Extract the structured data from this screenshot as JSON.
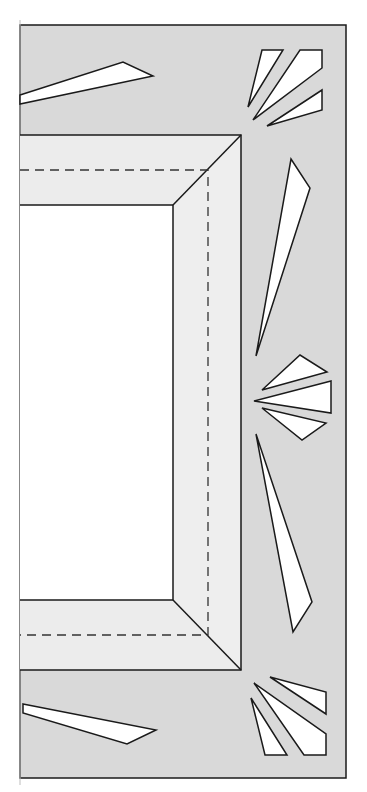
{
  "diagram": {
    "colors": {
      "background": "#ffffff",
      "board": "#d9d9d9",
      "frame_light": "#ececec",
      "window": "#ffffff",
      "cutout": "#ffffff",
      "stroke": "#1a1a1a"
    },
    "board": {
      "x1": 20,
      "y1": 25,
      "x2": 346,
      "y2": 778
    },
    "frame": {
      "outer_top": 135,
      "outer_bottom": 670,
      "outer_right": 241,
      "inner_top": 205,
      "inner_bottom": 600,
      "inner_right": 173,
      "dash_top": 170,
      "dash_bottom": 635,
      "dash_right": 208
    },
    "cutouts": [
      {
        "name": "top-left-sliver",
        "points": "20,95 123,62 153,76 20,104"
      },
      {
        "name": "top-right-fan-thin",
        "points": "262,50 283,50 248,107"
      },
      {
        "name": "top-right-fan-wide",
        "points": "300,50 322,50 322,68 253,120"
      },
      {
        "name": "top-right-fan-low",
        "points": "322,90 322,110 267,126"
      },
      {
        "name": "right-upper-sliver",
        "points": "291,159 310,188 256,356"
      },
      {
        "name": "right-fan-top",
        "points": "262,390 300,355 327,372"
      },
      {
        "name": "right-fan-middle",
        "points": "254,401 331,381 331,413"
      },
      {
        "name": "right-fan-bottom",
        "points": "262,408 326,423 302,440"
      },
      {
        "name": "right-lower-sliver",
        "points": "256,434 312,602 293,632"
      },
      {
        "name": "bottom-right-fan-top",
        "points": "270,677 326,692 326,714"
      },
      {
        "name": "bottom-right-fan-wide",
        "points": "254,683 326,734 326,755 304,755"
      },
      {
        "name": "bottom-right-fan-thin",
        "points": "251,698 287,755 265,755"
      },
      {
        "name": "bottom-left-sliver",
        "points": "23,704 156,730 127,744 23,713"
      }
    ]
  }
}
